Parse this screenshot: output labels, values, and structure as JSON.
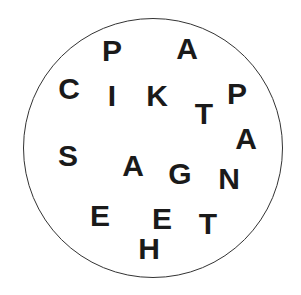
{
  "canvas": {
    "width": 301,
    "height": 295,
    "background_color": "#ffffff"
  },
  "circle": {
    "name": "boundary-circle",
    "center_x": 153,
    "center_y": 148,
    "radius": 130,
    "stroke_color": "#333333",
    "stroke_width": 1.5,
    "fill_color": "transparent"
  },
  "letters_text": "P A C I K P T S A G A N E E T H",
  "letters": [
    {
      "char": "P",
      "x": 112,
      "y": 51,
      "size": 30,
      "color": "#1a1a1a"
    },
    {
      "char": "A",
      "x": 187,
      "y": 49,
      "size": 30,
      "color": "#1a1a1a"
    },
    {
      "char": "C",
      "x": 69,
      "y": 89,
      "size": 30,
      "color": "#1a1a1a"
    },
    {
      "char": "I",
      "x": 112,
      "y": 96,
      "size": 30,
      "color": "#1a1a1a"
    },
    {
      "char": "K",
      "x": 157,
      "y": 96,
      "size": 30,
      "color": "#1a1a1a"
    },
    {
      "char": "P",
      "x": 237,
      "y": 94,
      "size": 30,
      "color": "#1a1a1a"
    },
    {
      "char": "T",
      "x": 204,
      "y": 114,
      "size": 30,
      "color": "#1a1a1a"
    },
    {
      "char": "A",
      "x": 246,
      "y": 139,
      "size": 30,
      "color": "#1a1a1a"
    },
    {
      "char": "S",
      "x": 68,
      "y": 156,
      "size": 30,
      "color": "#1a1a1a"
    },
    {
      "char": "A",
      "x": 133,
      "y": 166,
      "size": 30,
      "color": "#1a1a1a"
    },
    {
      "char": "G",
      "x": 180,
      "y": 174,
      "size": 30,
      "color": "#1a1a1a"
    },
    {
      "char": "N",
      "x": 229,
      "y": 179,
      "size": 30,
      "color": "#1a1a1a"
    },
    {
      "char": "E",
      "x": 100,
      "y": 216,
      "size": 30,
      "color": "#1a1a1a"
    },
    {
      "char": "E",
      "x": 162,
      "y": 219,
      "size": 30,
      "color": "#1a1a1a"
    },
    {
      "char": "T",
      "x": 208,
      "y": 224,
      "size": 30,
      "color": "#1a1a1a"
    },
    {
      "char": "H",
      "x": 149,
      "y": 249,
      "size": 30,
      "color": "#1a1a1a"
    }
  ]
}
